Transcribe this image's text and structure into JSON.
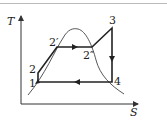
{
  "diagram": {
    "type": "T-S diagram (Rankine cycle)",
    "axes": {
      "y_label": "T",
      "x_label": "S"
    },
    "points": [
      {
        "id": "1",
        "label": "1"
      },
      {
        "id": "2",
        "label": "2"
      },
      {
        "id": "2p",
        "label": "2′"
      },
      {
        "id": "2pp",
        "label": "2″"
      },
      {
        "id": "3",
        "label": "3"
      },
      {
        "id": "4",
        "label": "4"
      }
    ],
    "process_path": [
      "1",
      "2",
      "2′",
      "2″",
      "3",
      "4",
      "1"
    ],
    "colors": {
      "cycle": "#222222",
      "dome": "#444444",
      "axes": "#333333"
    }
  }
}
